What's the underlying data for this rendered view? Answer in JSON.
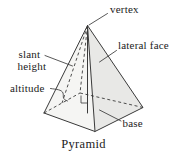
{
  "diagram": {
    "caption": "Pyramid",
    "labels": {
      "vertex": "vertex",
      "lateral_face": "lateral face",
      "slant_height_line1": "slant",
      "slant_height_line2": "height",
      "altitude": "altitude",
      "base": "base"
    },
    "colors": {
      "background": "#ffffff",
      "left_face_fill": "#f5f5f3",
      "right_face_fill": "#e8e8e6",
      "base_fill": "#ebebe9",
      "line_ink": "#3a3a3a",
      "text_ink": "#1b1b1b"
    }
  }
}
